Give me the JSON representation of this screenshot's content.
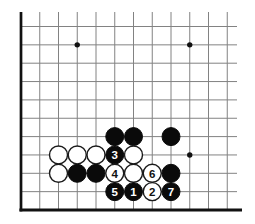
{
  "diagram": {
    "background_color": "#ffffff",
    "board": {
      "description": "bottom-left corner of a 19x19 Go board",
      "visible_cols": 12,
      "visible_rows": 11,
      "geometry": {
        "origin_x": 21,
        "bottom_edge_y": 210,
        "col_spacing": 18.75,
        "row_spacing": 18.35,
        "top_cut_y": 12,
        "right_cut_x": 237,
        "bottom_edge_x1": 19.4,
        "bottom_edge_x2": 242,
        "bottom_edge_thickness": 3.1,
        "left_edge_thickness": 2.7,
        "line_thickness": 1,
        "stone_radius": 9,
        "star_radius": 2.7,
        "label_font_size": 11.5
      },
      "colors": {
        "line": "#828282",
        "edge": "#111111",
        "black_stone": "#0a0a0a",
        "white_stone": "#ffffff",
        "white_stone_outline": "#1a1a1a",
        "label_on_white": "#111111",
        "label_on_black": "#ffffff",
        "star": "#111111"
      },
      "star_points": [
        {
          "col": 4,
          "row": 10
        },
        {
          "col": 10,
          "row": 10
        },
        {
          "col": 10,
          "row": 4
        }
      ],
      "stones": [
        {
          "col": 6,
          "row": 5,
          "color": "black",
          "label": ""
        },
        {
          "col": 7,
          "row": 5,
          "color": "black",
          "label": ""
        },
        {
          "col": 9,
          "row": 5,
          "color": "black",
          "label": ""
        },
        {
          "col": 3,
          "row": 4,
          "color": "white",
          "label": ""
        },
        {
          "col": 4,
          "row": 4,
          "color": "white",
          "label": ""
        },
        {
          "col": 5,
          "row": 4,
          "color": "white",
          "label": ""
        },
        {
          "col": 6,
          "row": 4,
          "color": "black",
          "label": "3"
        },
        {
          "col": 7,
          "row": 4,
          "color": "white",
          "label": ""
        },
        {
          "col": 3,
          "row": 3,
          "color": "white",
          "label": ""
        },
        {
          "col": 4,
          "row": 3,
          "color": "black",
          "label": ""
        },
        {
          "col": 5,
          "row": 3,
          "color": "black",
          "label": ""
        },
        {
          "col": 6,
          "row": 3,
          "color": "white",
          "label": "4"
        },
        {
          "col": 7,
          "row": 3,
          "color": "white",
          "label": ""
        },
        {
          "col": 8,
          "row": 3,
          "color": "white",
          "label": "6"
        },
        {
          "col": 9,
          "row": 3,
          "color": "black",
          "label": ""
        },
        {
          "col": 6,
          "row": 2,
          "color": "black",
          "label": "5"
        },
        {
          "col": 7,
          "row": 2,
          "color": "black",
          "label": "1"
        },
        {
          "col": 8,
          "row": 2,
          "color": "white",
          "label": "2"
        },
        {
          "col": 9,
          "row": 2,
          "color": "black",
          "label": "7"
        }
      ]
    }
  }
}
